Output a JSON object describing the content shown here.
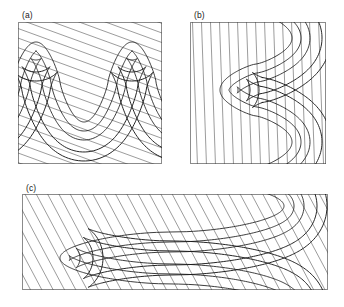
{
  "figure": {
    "kind": "structural-geology-fold-profiles",
    "background_color": "#ffffff",
    "line_color": "#1a1a1a",
    "frame_color": "#8b8b8b",
    "hatch_color": "#4a4a4a",
    "width": 344,
    "height": 307
  },
  "panels": [
    {
      "id": "a",
      "label": "(a)",
      "x": 18,
      "y": 22,
      "w": 144,
      "h": 142,
      "label_x": 22,
      "label_y": 11,
      "description": "upright-folds-horizontal-axial-surface",
      "hatch_angle_deg": 20,
      "layer_count": 5,
      "fold_wavelength_px": 96,
      "fold_amplitude_px": 52
    },
    {
      "id": "b",
      "label": "(b)",
      "x": 190,
      "y": 22,
      "w": 136,
      "h": 142,
      "label_x": 194,
      "label_y": 11,
      "description": "folds-rotated-ninety-degrees-vertical-hatching",
      "hatch_angle_deg": 88,
      "layer_count": 5,
      "fold_wavelength_px": 92,
      "fold_amplitude_px": 46
    },
    {
      "id": "c",
      "label": "(c)",
      "x": 22,
      "y": 194,
      "w": 306,
      "h": 96,
      "label_x": 26,
      "label_y": 184,
      "description": "recumbent-reclined-isoclinal-folds-wide-section",
      "hatch_angle_deg": 62,
      "layer_count": 5,
      "fold_wavelength_px": 150,
      "fold_amplitude_px": 40
    }
  ],
  "chart_data": {
    "type": "line",
    "title": "",
    "xlabel": "",
    "ylabel": "",
    "grid": false,
    "legend": "none",
    "panels": [
      {
        "id": "a",
        "panel_label": "(a)",
        "curve_family": "sinusoidal-fold-traces",
        "series": [
          {
            "name": "layer-boundary-1",
            "offset": 0
          },
          {
            "name": "layer-boundary-2",
            "offset": 9
          },
          {
            "name": "layer-boundary-3",
            "offset": 18
          },
          {
            "name": "layer-boundary-4",
            "offset": 30
          },
          {
            "name": "layer-boundary-5",
            "offset": 39
          }
        ],
        "hatched_band": {
          "between": [
            "layer-boundary-4",
            "layer-boundary-5"
          ],
          "hatch_spacing_px": 9
        }
      },
      {
        "id": "b",
        "panel_label": "(b)",
        "curve_family": "sinusoidal-fold-traces-rotated",
        "series": [
          {
            "name": "layer-boundary-1",
            "offset": 0
          },
          {
            "name": "layer-boundary-2",
            "offset": 9
          },
          {
            "name": "layer-boundary-3",
            "offset": 18
          },
          {
            "name": "layer-boundary-4",
            "offset": 30
          },
          {
            "name": "layer-boundary-5",
            "offset": 39
          }
        ],
        "hatched_band": {
          "between": [
            "layer-boundary-4",
            "layer-boundary-5"
          ],
          "hatch_spacing_px": 9
        }
      },
      {
        "id": "c",
        "panel_label": "(c)",
        "curve_family": "reclined-isoclinal-fold-traces",
        "series": [
          {
            "name": "layer-boundary-1",
            "offset": 0
          },
          {
            "name": "layer-boundary-2",
            "offset": 10
          },
          {
            "name": "layer-boundary-3",
            "offset": 20
          },
          {
            "name": "layer-boundary-4",
            "offset": 33
          },
          {
            "name": "layer-boundary-5",
            "offset": 43
          }
        ],
        "hatched_band": {
          "between": [
            "layer-boundary-4",
            "layer-boundary-5"
          ],
          "hatch_spacing_px": 10
        }
      }
    ]
  }
}
